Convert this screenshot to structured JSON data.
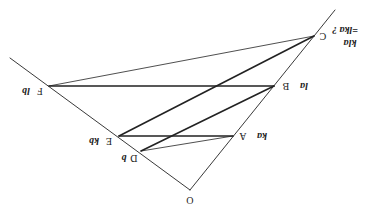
{
  "diagram": {
    "orientation": "rotated-180",
    "colors": {
      "line": "#222222",
      "background": "#ffffff"
    },
    "points": {
      "O": {
        "label": "O",
        "x": 190,
        "y": 190
      },
      "A": {
        "label": "A",
        "vector": "ka",
        "x": 233,
        "y": 136
      },
      "B": {
        "label": "B",
        "vector": "la",
        "x": 274,
        "y": 86
      },
      "C": {
        "label": "C",
        "vector": "kla",
        "vector2": "=lka ?",
        "x": 314,
        "y": 36
      },
      "D": {
        "label": "D",
        "vector": "b",
        "x": 141,
        "y": 151
      },
      "E": {
        "label": "E",
        "vector": "kb",
        "x": 119,
        "y": 136
      },
      "F": {
        "label": "F",
        "vector": "lb",
        "x": 49,
        "y": 86
      }
    },
    "segments": [
      {
        "from": "O",
        "to": "ray-a-end",
        "weight": "thin"
      },
      {
        "from": "O",
        "to": "ray-b-end",
        "weight": "thin"
      },
      {
        "from": "F",
        "to": "C",
        "weight": "thin"
      },
      {
        "from": "F",
        "to": "B",
        "weight": "thick"
      },
      {
        "from": "E",
        "to": "C",
        "weight": "thick"
      },
      {
        "from": "D",
        "to": "B",
        "weight": "thick"
      },
      {
        "from": "E",
        "to": "A",
        "weight": "thick"
      },
      {
        "from": "D",
        "to": "A",
        "weight": "thin"
      }
    ]
  }
}
